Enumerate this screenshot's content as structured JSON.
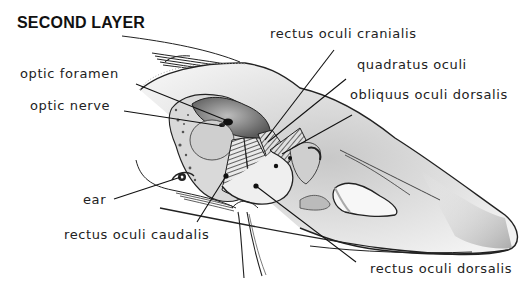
{
  "figure": {
    "title": "SECOND LAYER",
    "colors": {
      "ink": "#1a1a1a",
      "stipple": "#8a8a8a",
      "background": "#ffffff"
    },
    "labels": [
      {
        "id": "optic-foramen",
        "text": "optic foramen",
        "side": "left"
      },
      {
        "id": "optic-nerve",
        "text": "optic nerve",
        "side": "left"
      },
      {
        "id": "ear",
        "text": "ear",
        "side": "left"
      },
      {
        "id": "rectus-oculi-caudalis",
        "text": "rectus oculi caudalis",
        "side": "bottom-left"
      },
      {
        "id": "rectus-oculi-cranialis",
        "text": "rectus oculi cranialis",
        "side": "top-right"
      },
      {
        "id": "quadratus-oculi",
        "text": "quadratus oculi",
        "side": "right"
      },
      {
        "id": "obliquus-oculi-dorsalis",
        "text": "obliquus oculi dorsalis",
        "side": "right"
      },
      {
        "id": "rectus-oculi-dorsalis",
        "text": "rectus oculi dorsalis",
        "side": "bottom-right"
      }
    ]
  }
}
